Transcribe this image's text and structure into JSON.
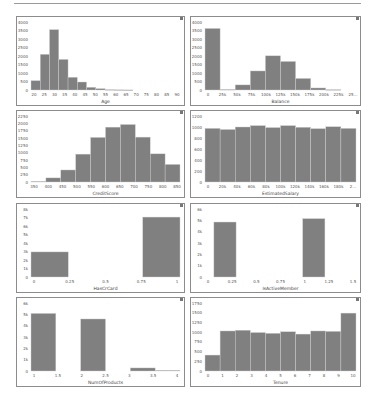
{
  "style": {
    "bar_color": "#808080",
    "bar_edge": "#cfcfcf",
    "frame_color": "#8c8c8c",
    "text_color": "#555555"
  },
  "chart_data": [
    {
      "type": "bar",
      "title": "",
      "xlabel": "Age",
      "ylabel": "",
      "bin_edges": [
        18,
        22.6,
        27.2,
        31.8,
        36.4,
        41,
        45.6,
        50.2,
        54.8,
        59.4,
        64,
        68.6,
        73.2,
        77.8,
        82.4,
        87,
        92
      ],
      "values": [
        550,
        2100,
        3550,
        1800,
        750,
        470,
        160,
        80,
        20,
        10,
        5,
        0,
        0,
        0,
        0,
        0
      ],
      "xticks": [
        "20",
        "25",
        "30",
        "35",
        "40",
        "45",
        "50",
        "55",
        "60",
        "65",
        "70",
        "75",
        "80",
        "85",
        "90"
      ],
      "xlim": [
        18,
        92
      ],
      "yticks": [
        "0",
        "500",
        "1000",
        "1500",
        "2000",
        "2500",
        "3000",
        "3500",
        "4000"
      ],
      "ylim": [
        0,
        4000
      ]
    },
    {
      "type": "bar",
      "title": "",
      "xlabel": "Balance",
      "ylabel": "",
      "bin_edges": [
        0,
        25,
        50,
        75,
        100,
        125,
        150,
        175,
        200,
        225,
        250
      ],
      "values": [
        3620,
        30,
        300,
        1120,
        2010,
        1680,
        680,
        120,
        20,
        0
      ],
      "xticks": [
        "0",
        "25k",
        "50k",
        "75k",
        "100k",
        "125k",
        "150k",
        "175k",
        "200k",
        "225k",
        "25..."
      ],
      "xlim": [
        0,
        250
      ],
      "yticks": [
        "0",
        "500",
        "1000",
        "1500",
        "2000",
        "2500",
        "3000",
        "3500",
        "4000"
      ],
      "ylim": [
        0,
        4000
      ]
    },
    {
      "type": "bar",
      "title": "",
      "xlabel": "CreditScore",
      "ylabel": "",
      "bin_edges": [
        350,
        400,
        450,
        500,
        550,
        600,
        650,
        700,
        750,
        800,
        850
      ],
      "values": [
        20,
        140,
        410,
        950,
        1520,
        1870,
        1960,
        1530,
        960,
        600
      ],
      "xticks": [
        "350",
        "400",
        "450",
        "500",
        "550",
        "600",
        "650",
        "700",
        "750",
        "800",
        "850"
      ],
      "xlim": [
        350,
        850
      ],
      "yticks": [
        "0",
        "250",
        "500",
        "750",
        "1000",
        "1250",
        "1500",
        "1750",
        "2000",
        "2250"
      ],
      "ylim": [
        0,
        2250
      ]
    },
    {
      "type": "bar",
      "title": "",
      "xlabel": "EstimatedSalary",
      "ylabel": "",
      "bin_edges": [
        0,
        20,
        40,
        60,
        80,
        100,
        120,
        140,
        160,
        180,
        200
      ],
      "values": [
        975,
        955,
        1000,
        1025,
        990,
        1025,
        995,
        970,
        1005,
        975
      ],
      "xticks": [
        "0",
        "20k",
        "40k",
        "60k",
        "80k",
        "100k",
        "120k",
        "140k",
        "160k",
        "180k",
        "2..."
      ],
      "xlim": [
        0,
        200
      ],
      "yticks": [
        "0",
        "200",
        "400",
        "600",
        "800",
        "1000",
        "1200"
      ],
      "ylim": [
        0,
        1200
      ]
    },
    {
      "type": "bar",
      "title": "",
      "xlabel": "HasCrCard",
      "ylabel": "",
      "bin_edges": [
        0,
        0.25,
        0.75,
        1
      ],
      "values": [
        2950,
        0,
        7050
      ],
      "xticks": [
        "0",
        "0.25",
        "0.5",
        "0.75",
        "1"
      ],
      "xlim": [
        0,
        1
      ],
      "yticks": [
        "0",
        "1k",
        "2k",
        "3k",
        "4k",
        "5k",
        "6k",
        "7k",
        "8k"
      ],
      "ylim": [
        0,
        8000
      ]
    },
    {
      "type": "bar",
      "title": "",
      "xlabel": "IsActiveMember",
      "ylabel": "",
      "bin_edges": [
        0,
        0.25,
        1,
        1.25
      ],
      "values": [
        4850,
        0,
        5150
      ],
      "xticks": [
        "0",
        "0.25",
        "0.5",
        "0.75",
        "1",
        "1.25",
        "1.5"
      ],
      "xlim": [
        -0.1,
        1.6
      ],
      "yticks": [
        "0",
        "1k",
        "2k",
        "3k",
        "4k",
        "5k",
        "6k"
      ],
      "ylim": [
        0,
        6000
      ]
    },
    {
      "type": "bar",
      "title": "",
      "xlabel": "NumOfProducts",
      "ylabel": "",
      "bin_edges": [
        1,
        1.5,
        2,
        2.5,
        3,
        3.5,
        4
      ],
      "values": [
        5080,
        0,
        4590,
        0,
        270,
        60
      ],
      "xticks": [
        "1",
        "1.5",
        "2",
        "2.5",
        "3",
        "3.5",
        "4"
      ],
      "xlim": [
        1,
        4
      ],
      "yticks": [
        "0",
        "1k",
        "2k",
        "3k",
        "4k",
        "5k",
        "6k"
      ],
      "ylim": [
        0,
        6000
      ]
    },
    {
      "type": "bar",
      "title": "",
      "xlabel": "Tenure",
      "ylabel": "",
      "bin_edges": [
        0,
        1,
        2,
        3,
        4,
        5,
        6,
        7,
        8,
        9,
        10
      ],
      "values": [
        410,
        1030,
        1050,
        990,
        970,
        1010,
        950,
        1030,
        1020,
        1490
      ],
      "xticks": [
        "0",
        "1",
        "2",
        "3",
        "4",
        "5",
        "6",
        "7",
        "8",
        "9",
        "10"
      ],
      "xlim": [
        0,
        10
      ],
      "yticks": [
        "0",
        "250",
        "500",
        "750",
        "1000",
        "1250",
        "1500",
        "1750"
      ],
      "ylim": [
        0,
        1750
      ]
    }
  ],
  "panels": [
    {
      "left": 16,
      "top": 16,
      "width": 169,
      "height": 90
    },
    {
      "left": 190,
      "top": 16,
      "width": 171,
      "height": 90
    },
    {
      "left": 16,
      "top": 110,
      "width": 169,
      "height": 88
    },
    {
      "left": 190,
      "top": 110,
      "width": 171,
      "height": 88
    },
    {
      "left": 16,
      "top": 203,
      "width": 169,
      "height": 90
    },
    {
      "left": 190,
      "top": 203,
      "width": 171,
      "height": 90
    },
    {
      "left": 16,
      "top": 297,
      "width": 169,
      "height": 90
    },
    {
      "left": 190,
      "top": 297,
      "width": 171,
      "height": 90
    }
  ]
}
